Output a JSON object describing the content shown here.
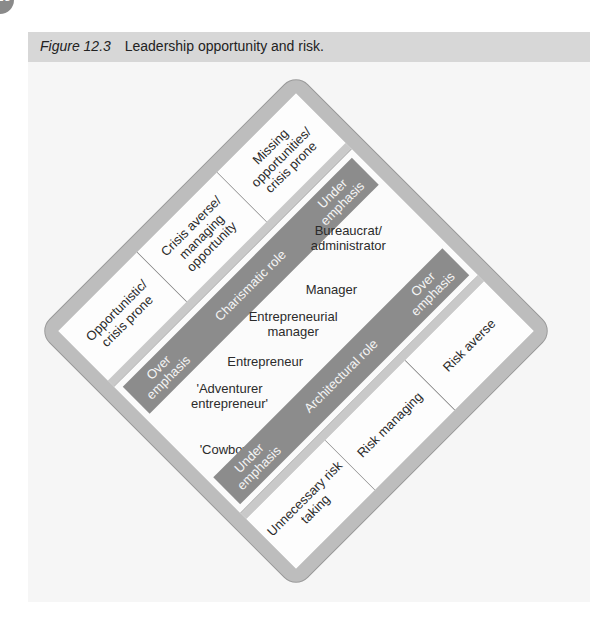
{
  "page": {
    "number": "18"
  },
  "figure": {
    "label": "Figure 12.3",
    "title": "Leadership opportunity and risk."
  },
  "diagram": {
    "opportunity_row": [
      {
        "label": "Opportunistic/ crisis prone"
      },
      {
        "label": "Crisis averse/ managing opportunity"
      },
      {
        "label": "Missing opportunities/ crisis prone"
      }
    ],
    "risk_row": [
      {
        "label": "Unnecessary risk taking"
      },
      {
        "label": "Risk managing"
      },
      {
        "label": "Risk averse"
      }
    ],
    "charismatic_band": {
      "left": "Over emphasis",
      "center": "Charismatic role",
      "right": "Under emphasis"
    },
    "architectural_band": {
      "left": "Under emphasis",
      "center": "Architectural role",
      "right": "Over emphasis"
    },
    "roles": [
      {
        "label": "'Cowboy'"
      },
      {
        "label": "'Adventurer entrepreneur'"
      },
      {
        "label": "Entrepreneur"
      },
      {
        "label": "Entrepreneurial manager"
      },
      {
        "label": "Manager"
      },
      {
        "label": "Bureaucrat/ administrator"
      }
    ],
    "colors": {
      "frame": "#bdbdbd",
      "band": "#8c8c8c",
      "caption_bar": "#d7d7d7"
    }
  }
}
